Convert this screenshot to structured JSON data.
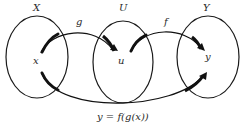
{
  "diagram": {
    "sets": [
      {
        "id": "X",
        "label": "X",
        "element": "x"
      },
      {
        "id": "U",
        "label": "U",
        "element": "u"
      },
      {
        "id": "Y",
        "label": "Y",
        "element": "y"
      }
    ],
    "arrows": [
      {
        "id": "g",
        "label": "g",
        "from": "x",
        "to": "u"
      },
      {
        "id": "f",
        "label": "f",
        "from": "u",
        "to": "y"
      },
      {
        "id": "composite",
        "label": "",
        "from": "x",
        "to": "y"
      }
    ],
    "caption": "y = f(g(x))",
    "colors": {
      "stroke": "#1a1a1a",
      "arrow": "#111111",
      "text": "#2a2a2a",
      "background": "#ffffff"
    }
  }
}
